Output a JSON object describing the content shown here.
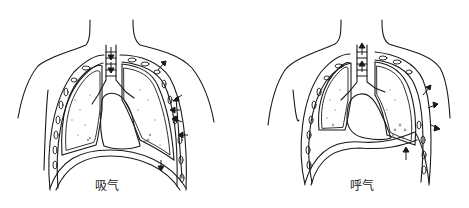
{
  "figure": {
    "panels": [
      {
        "id": "inhale",
        "label": "吸气",
        "diaphragm": "flattened / lowered",
        "arrows": "inward at trachea, ribs moving outward"
      },
      {
        "id": "exhale",
        "label": "呼气",
        "diaphragm": "domed / raised",
        "arrows": "outward at trachea, ribs moving inward"
      }
    ]
  },
  "colors": {
    "line": "#1a1a1a",
    "background": "#ffffff",
    "shade": "#555555"
  }
}
